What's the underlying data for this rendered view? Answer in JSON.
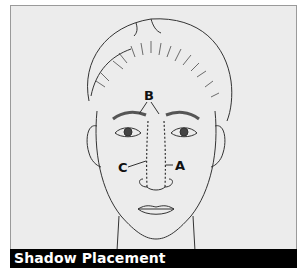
{
  "caption": "Shadow Placement",
  "labels": {
    "a": "A",
    "b": "B",
    "c": "C"
  },
  "colors": {
    "background": "#ececec",
    "line": "#333333",
    "caption_bg": "#000000",
    "caption_text": "#ffffff"
  }
}
